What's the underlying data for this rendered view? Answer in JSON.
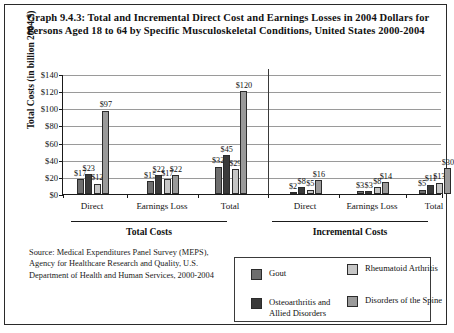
{
  "title": "Graph 9.4.3: Total and Incremental Direct Cost and Earnings Losses in 2004 Dollars for Persons Aged 18 to 64 by Specific Musculoskeletal Conditions, United States 2000-2004",
  "source": "Source: Medical Expenditures Panel Survey (MEPS), Agency for Healthcare Research and Quality, U.S. Department of Health and Human Services, 2000-2004",
  "sections": [
    {
      "label": "Total Costs"
    },
    {
      "label": "Incremental Costs"
    }
  ],
  "legend": [
    {
      "label": "Gout",
      "color": "#6e6e6e"
    },
    {
      "label": "Rheumatoid Arthritis",
      "color": "#c6c6c6"
    },
    {
      "label": "Osteoarthritis and Allied Disorders",
      "color": "#3a3a3a"
    },
    {
      "label": "Disorders of the Spine",
      "color": "#9a9a9a"
    }
  ],
  "chart_data": {
    "type": "bar",
    "title": "Graph 9.4.3: Total and Incremental Direct Cost and Earnings Losses in 2004 Dollars for Persons Aged 18 to 64 by Specific Musculoskeletal Conditions, United States 2000-2004",
    "xlabel": "",
    "ylabel": "Total Costs (in billion 2004 $)",
    "ylim": [
      0,
      140
    ],
    "ytick_step": 20,
    "ytick_labels": [
      "$0",
      "$20",
      "$40",
      "$60",
      "$80",
      "$100",
      "$120",
      "$140"
    ],
    "grid": true,
    "legend_position": "bottom-right",
    "categories": [
      "Direct",
      "Earnings Loss",
      "Total",
      "Direct",
      "Earnings Loss",
      "Total"
    ],
    "category_sections": [
      "Total Costs",
      "Total Costs",
      "Total Costs",
      "Incremental Costs",
      "Incremental Costs",
      "Incremental Costs"
    ],
    "series": [
      {
        "name": "Gout",
        "color": "#6e6e6e",
        "values": [
          17,
          15,
          32,
          2,
          3,
          5
        ],
        "labels": [
          "$17",
          "$15",
          "$32",
          "$2",
          "$3",
          "$5"
        ]
      },
      {
        "name": "Osteoarthritis and Allied Disorders",
        "color": "#3a3a3a",
        "values": [
          23,
          22,
          45,
          8,
          3,
          11
        ],
        "labels": [
          "$23",
          "$22",
          "$45",
          "$8",
          "$3",
          "$11"
        ]
      },
      {
        "name": "Rheumatoid Arthritis",
        "color": "#c6c6c6",
        "values": [
          12,
          17,
          29,
          5,
          8,
          13
        ],
        "labels": [
          "$12",
          "$17",
          "$29",
          "$5",
          "$8",
          "$13"
        ]
      },
      {
        "name": "Disorders of the Spine",
        "color": "#9a9a9a",
        "values": [
          97,
          22,
          120,
          16,
          14,
          30
        ],
        "labels": [
          "$97",
          "$22",
          "$120",
          "$16",
          "$14",
          "$30"
        ]
      }
    ]
  }
}
